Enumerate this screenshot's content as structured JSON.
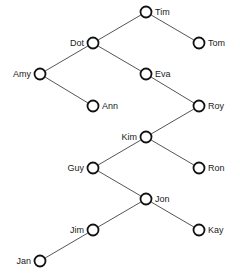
{
  "diagram": {
    "type": "binary-search-tree",
    "nodes": [
      {
        "id": "Tim",
        "label": "Tim",
        "x": 146,
        "y": 12,
        "side": "right"
      },
      {
        "id": "Dot",
        "label": "Dot",
        "x": 93,
        "y": 43,
        "side": "left"
      },
      {
        "id": "Tom",
        "label": "Tom",
        "x": 199,
        "y": 43,
        "side": "right"
      },
      {
        "id": "Amy",
        "label": "Amy",
        "x": 40,
        "y": 74,
        "side": "left"
      },
      {
        "id": "Eva",
        "label": "Eva",
        "x": 146,
        "y": 74,
        "side": "right"
      },
      {
        "id": "Ann",
        "label": "Ann",
        "x": 93,
        "y": 106,
        "side": "right"
      },
      {
        "id": "Roy",
        "label": "Roy",
        "x": 199,
        "y": 106,
        "side": "right"
      },
      {
        "id": "Kim",
        "label": "Kim",
        "x": 146,
        "y": 137,
        "side": "left"
      },
      {
        "id": "Guy",
        "label": "Guy",
        "x": 93,
        "y": 168,
        "side": "left"
      },
      {
        "id": "Ron",
        "label": "Ron",
        "x": 199,
        "y": 168,
        "side": "right"
      },
      {
        "id": "Jon",
        "label": "Jon",
        "x": 146,
        "y": 199,
        "side": "right"
      },
      {
        "id": "Jim",
        "label": "Jim",
        "x": 93,
        "y": 230,
        "side": "left"
      },
      {
        "id": "Kay",
        "label": "Kay",
        "x": 199,
        "y": 230,
        "side": "right"
      },
      {
        "id": "Jan",
        "label": "Jan",
        "x": 40,
        "y": 261,
        "side": "left"
      }
    ],
    "edges": [
      [
        "Tim",
        "Dot"
      ],
      [
        "Tim",
        "Tom"
      ],
      [
        "Dot",
        "Amy"
      ],
      [
        "Dot",
        "Eva"
      ],
      [
        "Amy",
        "Ann"
      ],
      [
        "Eva",
        "Roy"
      ],
      [
        "Roy",
        "Kim"
      ],
      [
        "Kim",
        "Guy"
      ],
      [
        "Kim",
        "Ron"
      ],
      [
        "Guy",
        "Jon"
      ],
      [
        "Jon",
        "Jim"
      ],
      [
        "Jon",
        "Kay"
      ],
      [
        "Jim",
        "Jan"
      ]
    ]
  }
}
